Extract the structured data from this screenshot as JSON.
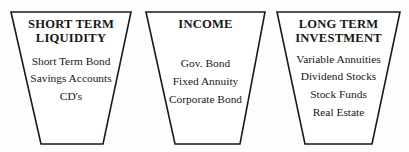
{
  "diagram": {
    "type": "three-funnel-categories",
    "background_color": "#fdfdfd",
    "line_color": "#1a1a1a",
    "text_color": "#171717",
    "groups": [
      {
        "id": "short-term-liquidity",
        "title_lines": [
          "SHORT TERM",
          "LIQUIDITY"
        ],
        "items": [
          "Short Term Bond",
          "Savings Accounts",
          "CD's"
        ],
        "shape": {
          "top_left_x": 11,
          "top_right_x": 131,
          "bottom_left_x": 41,
          "bottom_right_x": 103,
          "top_y": 12,
          "bottom_y": 144
        }
      },
      {
        "id": "income",
        "title_lines": [
          "INCOME"
        ],
        "items": [
          "Gov. Bond",
          "Fixed Annuity",
          "Corporate Bond"
        ],
        "shape": {
          "top_left_x": 146,
          "top_right_x": 265,
          "bottom_left_x": 175,
          "bottom_right_x": 240,
          "top_y": 12,
          "bottom_y": 144
        }
      },
      {
        "id": "long-term-investment",
        "title_lines": [
          "LONG TERM",
          "INVESTMENT"
        ],
        "items": [
          "Variable Annuities",
          "Dividend Stocks",
          "Stock Funds",
          "Real Estate"
        ],
        "shape": {
          "top_left_x": 277,
          "top_right_x": 400,
          "bottom_left_x": 305,
          "bottom_right_x": 372,
          "top_y": 12,
          "bottom_y": 144
        }
      }
    ]
  }
}
